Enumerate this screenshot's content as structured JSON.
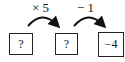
{
  "diagram": {
    "operations": [
      {
        "label": "× 5",
        "from": 0,
        "to": 1
      },
      {
        "label": "− 1",
        "from": 1,
        "to": 2
      }
    ],
    "boxes": [
      {
        "value": "?"
      },
      {
        "value": "?"
      },
      {
        "value": "−4"
      }
    ]
  }
}
